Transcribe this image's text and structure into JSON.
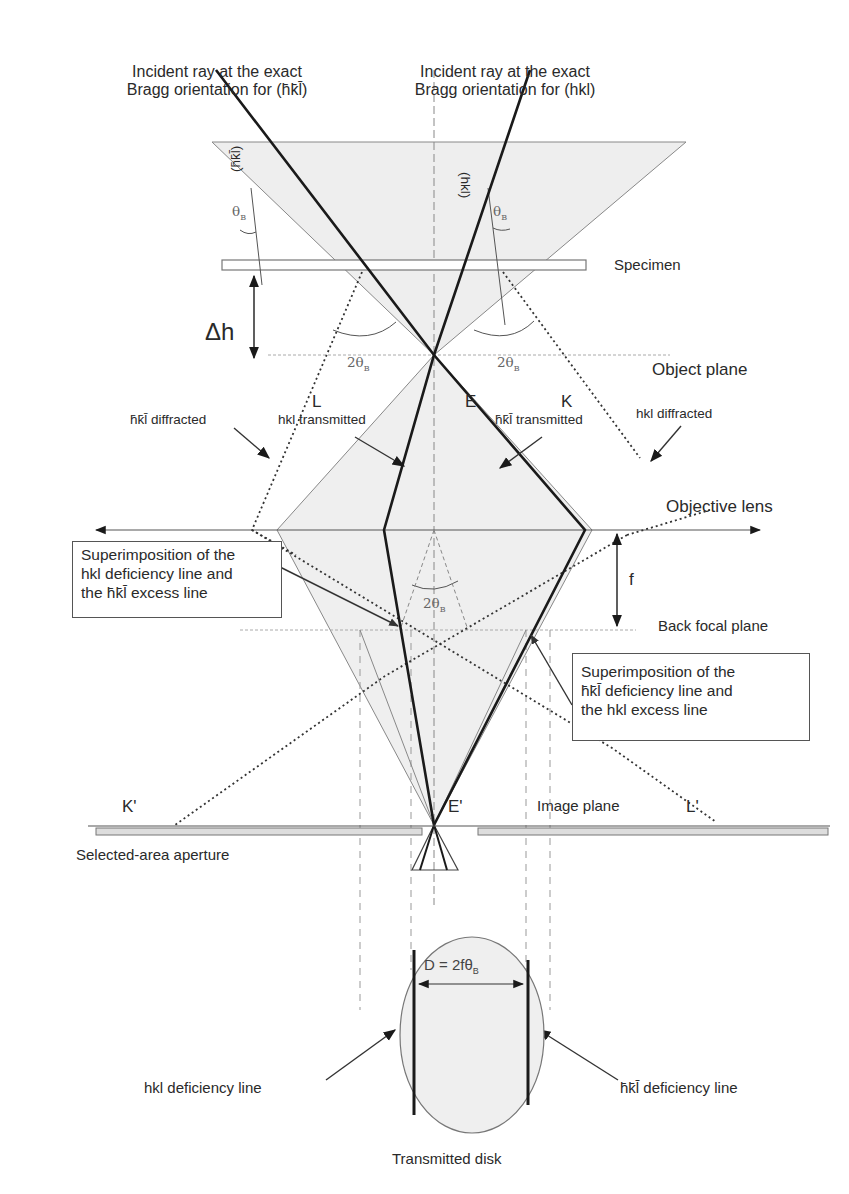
{
  "figure": {
    "title_left": {
      "line1": "Incident ray at the exact",
      "line2": "Bragg orientation for (h̄k̄l̄)"
    },
    "title_right": {
      "line1": "Incident ray at the exact",
      "line2": "Bragg orientation for (hkl)"
    },
    "planes": {
      "specimen": "Specimen",
      "object_plane": "Object plane",
      "objective_lens": "Objective lens",
      "back_focal_plane": "Back focal plane",
      "image_plane": "Image plane",
      "selected_area_aperture": "Selected-area aperture"
    },
    "points": {
      "L": "L",
      "E": "E",
      "K": "K",
      "K_prime": "K'",
      "E_prime": "E'",
      "L_prime": "L'"
    },
    "plane_labels": {
      "left": "(h̄k̄l̄)",
      "right": "(hkl)"
    },
    "angles": {
      "theta_b": "θ",
      "theta_sub": "B",
      "two_theta": "2θ"
    },
    "dimensions": {
      "delta_h": "Δh",
      "f": "f",
      "disk_width": "D = 2fθ",
      "disk_width_sub": "B"
    },
    "beams": {
      "left_diffracted": "h̄k̄l̄ diffracted",
      "left_transmitted": "hkl transmitted",
      "right_transmitted": "h̄k̄l̄ transmitted",
      "right_diffracted": "hkl diffracted"
    },
    "callouts": {
      "left_box": {
        "line1": "Superimposition of the",
        "line2": "hkl deficiency line and",
        "line3": "the h̄k̄l̄ excess line"
      },
      "right_box": {
        "line1": "Superimposition of the",
        "line2": "h̄k̄l̄ deficiency line and",
        "line3": "the hkl excess line"
      }
    },
    "disk": {
      "caption": "Transmitted disk",
      "left_line": "hkl deficiency line",
      "right_line": "h̄k̄l̄ deficiency line"
    },
    "colors": {
      "ray": "#1a1a1a",
      "thin": "#777777",
      "fill": "#ececec",
      "guide": "#999999"
    }
  }
}
